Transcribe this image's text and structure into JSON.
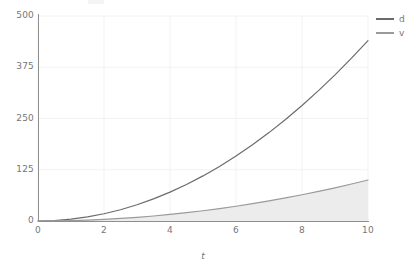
{
  "chart_data": {
    "type": "line",
    "title": "",
    "xlabel": "t",
    "ylabel": "",
    "xlim": [
      0,
      10
    ],
    "ylim": [
      0,
      500
    ],
    "grid": true,
    "legend_position": "right",
    "x_ticks": [
      "0",
      "2",
      "4",
      "6",
      "8",
      "10"
    ],
    "x_tick_values": [
      0,
      2,
      4,
      6,
      8,
      10
    ],
    "y_ticks": [
      "0",
      "125",
      "250",
      "375",
      "500"
    ],
    "y_tick_values": [
      0,
      125,
      250,
      375,
      500
    ],
    "x": [
      0,
      0.5,
      1,
      1.5,
      2,
      2.5,
      3,
      3.5,
      4,
      4.5,
      5,
      5.5,
      6,
      6.5,
      7,
      7.5,
      8,
      8.5,
      9,
      9.5,
      10
    ],
    "series": [
      {
        "name": "d",
        "color": "#6b6b6b",
        "fill": false,
        "values": [
          0,
          1.1,
          4.4,
          9.9,
          17.6,
          27.5,
          39.6,
          53.9,
          70.4,
          89.1,
          110,
          133.1,
          158.4,
          185.9,
          215.6,
          247.5,
          281.6,
          317.9,
          356.4,
          397.1,
          440
        ]
      },
      {
        "name": "v",
        "color": "#9a9a9a",
        "fill": true,
        "fill_color": "#ececec",
        "values": [
          0,
          0.25,
          1,
          2.25,
          4,
          6.25,
          9,
          12.25,
          16,
          20.25,
          25,
          30.25,
          36,
          42.25,
          49,
          56.25,
          64,
          72.25,
          81,
          90.25,
          100
        ]
      }
    ]
  },
  "legend": {
    "entries": [
      {
        "label": "d"
      },
      {
        "label": "v"
      }
    ]
  },
  "colors": {
    "axis": "#8f8f8f",
    "grid": "#f2f2f2",
    "tick_text": "#76767a",
    "series_d": "#6b6b6b",
    "series_v": "#9a9a9a",
    "fill_v": "#ececec",
    "background": "#ffffff"
  }
}
